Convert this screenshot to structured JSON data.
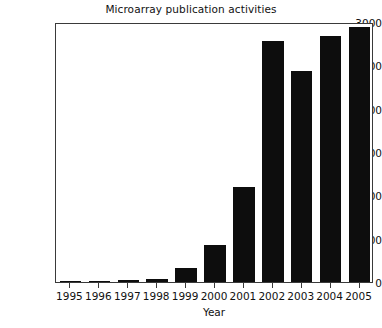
{
  "chart_data": {
    "type": "bar",
    "title": "Microarray publication activities",
    "xlabel": "Year",
    "ylabel": "",
    "categories": [
      "1995",
      "1996",
      "1997",
      "1998",
      "1999",
      "2000",
      "2001",
      "2002",
      "2003",
      "2004",
      "2005"
    ],
    "values": [
      10,
      15,
      25,
      40,
      160,
      430,
      1100,
      2780,
      2430,
      2840,
      2940
    ],
    "ylim": [
      0,
      3000
    ],
    "yticks": [
      0,
      500,
      1000,
      1500,
      2000,
      2500,
      3000
    ],
    "ytick_labels": [
      "0",
      "500",
      "1000",
      "1500",
      "2000",
      "2500",
      "3000"
    ],
    "grid": false,
    "legend": null,
    "bar_color": "#0d0d0d",
    "axis_color": "#3a3a3a",
    "background": "#ffffff"
  }
}
